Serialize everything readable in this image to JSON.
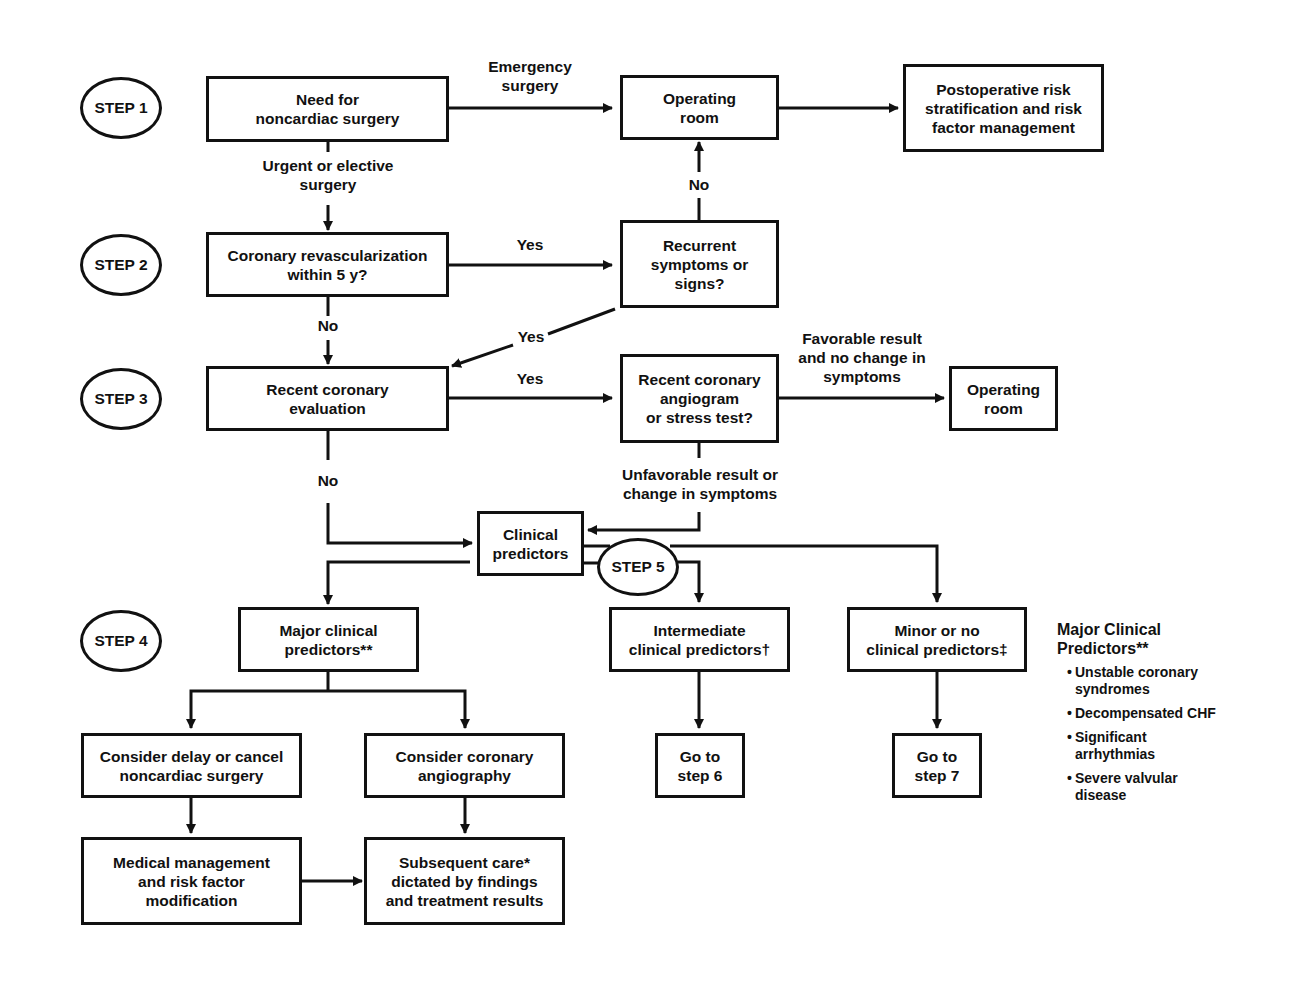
{
  "steps": {
    "step1": "STEP 1",
    "step2": "STEP 2",
    "step3": "STEP 3",
    "step4": "STEP 4",
    "step5": "STEP 5"
  },
  "nodes": {
    "need_surgery": "Need for\nnoncardiac surgery",
    "operating_room_1": "Operating\nroom",
    "postoperative": "Postoperative risk\nstratification and risk\nfactor management",
    "revascularization": "Coronary revascularization\nwithin 5 y?",
    "recurrent_symptoms": "Recurrent\nsymptoms or\nsigns?",
    "recent_evaluation": "Recent coronary\nevaluation",
    "recent_angiogram": "Recent coronary\nangiogram\nor stress test?",
    "operating_room_2": "Operating\nroom",
    "clinical_predictors": "Clinical\npredictors",
    "major_predictors": "Major clinical\npredictors**",
    "intermediate_predictors": "Intermediate\nclinical predictors†",
    "minor_predictors": "Minor or no\nclinical predictors‡",
    "delay_cancel": "Consider delay or cancel\nnoncardiac surgery",
    "coronary_angiography": "Consider coronary\nangiography",
    "medical_management": "Medical management\nand risk factor\nmodification",
    "subsequent_care": "Subsequent care*\ndictated by findings\nand treatment results",
    "go_step6": "Go to\nstep 6",
    "go_step7": "Go to\nstep 7"
  },
  "edge_labels": {
    "emergency": "Emergency\nsurgery",
    "urgent_elective": "Urgent or elective\nsurgery",
    "no_recurrent_to_or": "No",
    "yes_revasc": "Yes",
    "no_revasc": "No",
    "yes_recurrent": "Yes",
    "yes_recent_eval": "Yes",
    "favorable": "Favorable result\nand no change in\nsymptoms",
    "no_recent_eval": "No",
    "unfavorable": "Unfavorable result or\nchange in symptoms"
  },
  "legend": {
    "title": "Major Clinical\nPredictors**",
    "bullet": "•",
    "items": [
      "Unstable coronary\nsyndromes",
      "Decompensated CHF",
      "Significant\narrhythmias",
      "Severe valvular\ndisease"
    ]
  }
}
